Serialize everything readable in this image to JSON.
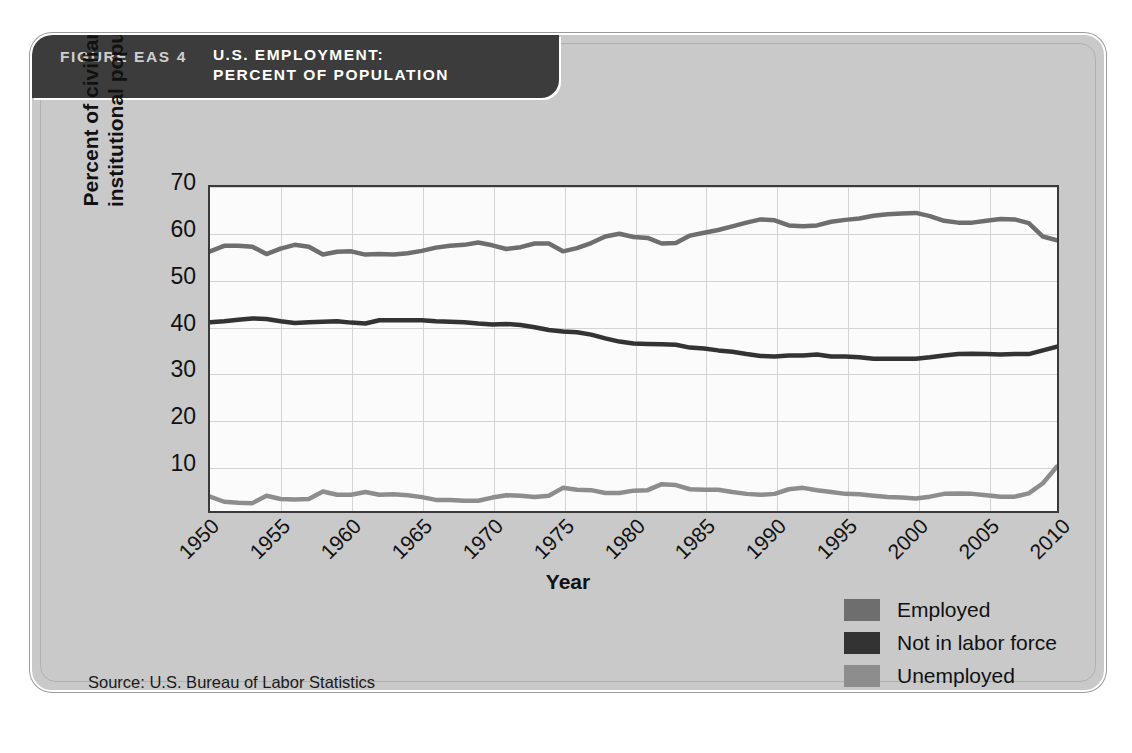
{
  "figure": {
    "number_label": "FIGURE EAS 4",
    "title_line1": "U.S. EMPLOYMENT:",
    "title_line2": "PERCENT OF POPULATION",
    "source": "Source: U.S. Bureau of Labor Statistics"
  },
  "colors": {
    "employed": "#6e6e6e",
    "not_in_labor_force": "#333333",
    "unemployed": "#8d8d8d",
    "header_band": "#3c3c3c",
    "card_background": "#c9c9c9",
    "plot_background": "#fbfbfb",
    "gridline": "#d3d3d3",
    "axis": "#3a3a3a"
  },
  "legend": {
    "position": "bottom-right",
    "items": [
      {
        "label": "Employed",
        "color": "#6e6e6e"
      },
      {
        "label": "Not in labor force",
        "color": "#333333"
      },
      {
        "label": "Unemployed",
        "color": "#8d8d8d"
      }
    ]
  },
  "chart_data": {
    "type": "line",
    "title": "U.S. EMPLOYMENT: PERCENT OF POPULATION",
    "xlabel": "Year",
    "ylabel": "Percent of civilian non-institutional population",
    "xlim": [
      1950,
      2010
    ],
    "ylim": [
      0,
      70
    ],
    "yticks": [
      10,
      20,
      30,
      40,
      50,
      60,
      70
    ],
    "xticks": [
      1950,
      1955,
      1960,
      1965,
      1970,
      1975,
      1980,
      1985,
      1990,
      1995,
      2000,
      2005,
      2010
    ],
    "grid": true,
    "legend_position": "bottom-right",
    "x": [
      1950,
      1951,
      1952,
      1953,
      1954,
      1955,
      1956,
      1957,
      1958,
      1959,
      1960,
      1961,
      1962,
      1963,
      1964,
      1965,
      1966,
      1967,
      1968,
      1969,
      1970,
      1971,
      1972,
      1973,
      1974,
      1975,
      1976,
      1977,
      1978,
      1979,
      1980,
      1981,
      1982,
      1983,
      1984,
      1985,
      1986,
      1987,
      1988,
      1989,
      1990,
      1991,
      1992,
      1993,
      1994,
      1995,
      1996,
      1997,
      1998,
      1999,
      2000,
      2001,
      2002,
      2003,
      2004,
      2005,
      2006,
      2007,
      2008,
      2009,
      2010
    ],
    "series": [
      {
        "name": "Employed",
        "color": "#6e6e6e",
        "values": [
          56.1,
          57.3,
          57.3,
          57.1,
          55.5,
          56.7,
          57.5,
          57.1,
          55.4,
          56.0,
          56.1,
          55.4,
          55.5,
          55.4,
          55.7,
          56.2,
          56.9,
          57.3,
          57.5,
          58.0,
          57.4,
          56.6,
          57.0,
          57.8,
          57.8,
          56.1,
          56.8,
          57.9,
          59.3,
          59.9,
          59.2,
          59.0,
          57.8,
          57.9,
          59.5,
          60.1,
          60.7,
          61.5,
          62.3,
          63.0,
          62.8,
          61.7,
          61.5,
          61.7,
          62.5,
          62.9,
          63.2,
          63.8,
          64.1,
          64.3,
          64.4,
          63.7,
          62.7,
          62.3,
          62.3,
          62.7,
          63.1,
          63.0,
          62.2,
          59.3,
          58.5
        ]
      },
      {
        "name": "Not in labor force",
        "color": "#333333",
        "values": [
          40.8,
          41.0,
          41.3,
          41.6,
          41.5,
          41.0,
          40.6,
          40.8,
          40.9,
          41.0,
          40.7,
          40.5,
          41.2,
          41.2,
          41.2,
          41.2,
          41.0,
          40.9,
          40.8,
          40.5,
          40.3,
          40.4,
          40.2,
          39.7,
          39.1,
          38.8,
          38.6,
          38.1,
          37.3,
          36.6,
          36.2,
          36.1,
          36.0,
          35.9,
          35.3,
          35.1,
          34.7,
          34.4,
          33.9,
          33.5,
          33.4,
          33.6,
          33.6,
          33.8,
          33.4,
          33.4,
          33.2,
          32.9,
          32.9,
          32.9,
          32.9,
          33.2,
          33.6,
          33.9,
          34.0,
          33.9,
          33.8,
          33.9,
          33.9,
          34.7,
          35.5
        ]
      },
      {
        "name": "Unemployed",
        "color": "#8d8d8d",
        "values": [
          3.1,
          2.0,
          1.8,
          1.7,
          3.3,
          2.6,
          2.5,
          2.6,
          4.2,
          3.5,
          3.5,
          4.1,
          3.5,
          3.6,
          3.4,
          3.0,
          2.4,
          2.4,
          2.2,
          2.2,
          2.9,
          3.4,
          3.3,
          3.0,
          3.3,
          5.0,
          4.6,
          4.5,
          3.9,
          3.9,
          4.4,
          4.5,
          5.8,
          5.6,
          4.7,
          4.6,
          4.6,
          4.1,
          3.7,
          3.5,
          3.7,
          4.7,
          5.0,
          4.5,
          4.1,
          3.7,
          3.6,
          3.3,
          3.0,
          2.9,
          2.7,
          3.1,
          3.7,
          3.8,
          3.7,
          3.4,
          3.1,
          3.1,
          3.8,
          6.0,
          9.6
        ]
      }
    ]
  }
}
